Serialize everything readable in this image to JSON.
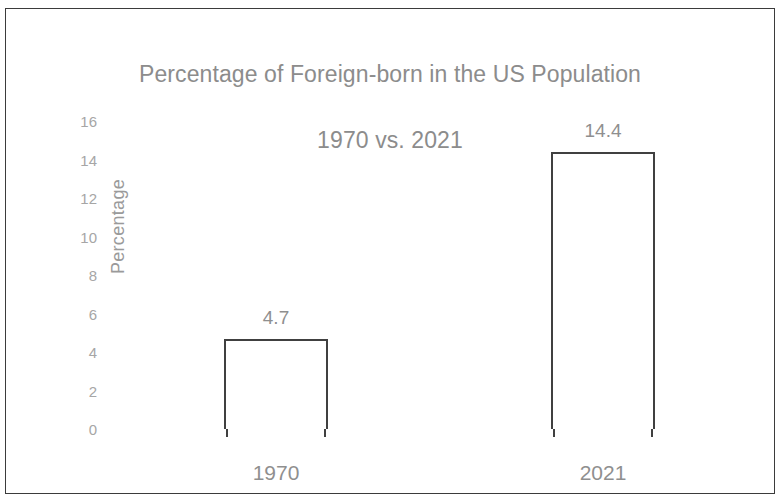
{
  "chart_data": {
    "type": "bar",
    "title": "Percentage of Foreign-born in the US Population\n1970 vs. 2021",
    "title_line1": "Percentage of Foreign-born in the US Population",
    "title_line2": "1970 vs. 2021",
    "categories": [
      "1970",
      "2021"
    ],
    "values": [
      4.7,
      14.4
    ],
    "data_labels": [
      "4.7",
      "14.4"
    ],
    "xlabel": "",
    "ylabel": "Percentage",
    "ylim": [
      0,
      16
    ],
    "ytick_step": 2,
    "yticks": [
      16,
      14,
      12,
      10,
      8,
      6,
      4,
      2,
      0
    ],
    "ytick_labels": [
      "16",
      "14",
      "12",
      "10",
      "8",
      "6",
      "4",
      "2",
      "0"
    ],
    "grid": false,
    "legend": false,
    "bar_fill": "#ffffff",
    "bar_outline": "#404040",
    "text_color": "#8f8f8f",
    "tick_color": "#a6a6a6",
    "title_color": "#8c8c8c",
    "background": "#ffffff",
    "frame_color": "#3b3b3b"
  }
}
